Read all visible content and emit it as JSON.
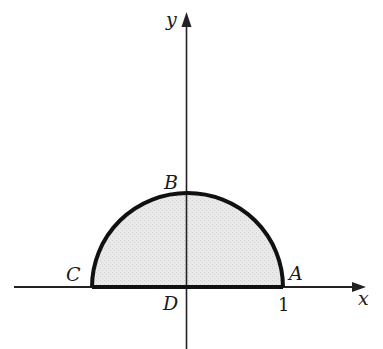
{
  "diagram": {
    "type": "semicircular region in the xy-plane",
    "axes": {
      "x_label": "x",
      "y_label": "y"
    },
    "points": {
      "A": "A",
      "B": "B",
      "C": "C",
      "D": "D"
    },
    "tick_labels": {
      "x_one": "1"
    },
    "colors": {
      "fill": "#e6e6e6",
      "stroke": "#111111",
      "axis": "#222222"
    }
  }
}
